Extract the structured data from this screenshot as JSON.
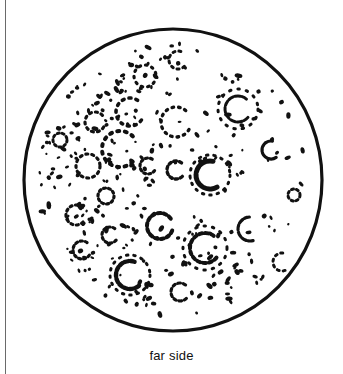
{
  "figure": {
    "caption": "far side",
    "colors": {
      "ink": "#111111",
      "background": "#ffffff",
      "frame_line": "#6a6a6a"
    },
    "disc": {
      "cx": 173,
      "cy": 180,
      "rx": 149,
      "ry": 151,
      "stroke_width": 3.2
    },
    "craters": [
      {
        "cx": 145,
        "cy": 76,
        "r": 11,
        "w": 3.2,
        "dash": "1.5 5",
        "gap": 0
      },
      {
        "cx": 130,
        "cy": 112,
        "r": 14,
        "w": 3.6,
        "dash": "2 5",
        "gap": 70
      },
      {
        "cx": 176,
        "cy": 122,
        "r": 15,
        "w": 3.4,
        "dash": "1.5 5",
        "gap": 60
      },
      {
        "cx": 120,
        "cy": 149,
        "r": 18,
        "w": 4,
        "dash": "2 5.5",
        "gap": 90
      },
      {
        "cx": 176,
        "cy": 170,
        "r": 9,
        "w": 3.4,
        "dash": "2.5 3",
        "gap": 90
      },
      {
        "cx": 210,
        "cy": 175,
        "r": 14,
        "w": 5,
        "dash": "6 2",
        "gap": 120
      },
      {
        "cx": 210,
        "cy": 175,
        "r": 20,
        "w": 3,
        "dash": "1.5 6",
        "gap": 0
      },
      {
        "cx": 238,
        "cy": 109,
        "r": 13,
        "w": 3,
        "dash": "5 2",
        "gap": 80
      },
      {
        "cx": 238,
        "cy": 109,
        "r": 20,
        "w": 3,
        "dash": "1.5 7",
        "gap": 0
      },
      {
        "cx": 271,
        "cy": 150,
        "r": 9,
        "w": 3.2,
        "dash": "8 1",
        "gap": 110
      },
      {
        "cx": 160,
        "cy": 226,
        "r": 13,
        "w": 4,
        "dash": "3 3",
        "gap": 40
      },
      {
        "cx": 205,
        "cy": 248,
        "r": 15,
        "w": 4,
        "dash": "3 3",
        "gap": 80
      },
      {
        "cx": 205,
        "cy": 248,
        "r": 22,
        "w": 3,
        "dash": "1.5 7",
        "gap": 0
      },
      {
        "cx": 250,
        "cy": 229,
        "r": 12,
        "w": 3.2,
        "dash": "5 2",
        "gap": 150
      },
      {
        "cx": 130,
        "cy": 275,
        "r": 14,
        "w": 4.4,
        "dash": "4 2",
        "gap": 100
      },
      {
        "cx": 130,
        "cy": 275,
        "r": 20,
        "w": 3,
        "dash": "1.5 6",
        "gap": 0
      },
      {
        "cx": 180,
        "cy": 292,
        "r": 9,
        "w": 3.2,
        "dash": "2.5 3",
        "gap": 90
      },
      {
        "cx": 95,
        "cy": 122,
        "r": 10,
        "w": 3.2,
        "dash": "2 4",
        "gap": 60
      },
      {
        "cx": 88,
        "cy": 166,
        "r": 12,
        "w": 3.2,
        "dash": "2 4",
        "gap": 0
      },
      {
        "cx": 76,
        "cy": 215,
        "r": 10,
        "w": 3.2,
        "dash": "2 3.5",
        "gap": 90
      },
      {
        "cx": 82,
        "cy": 250,
        "r": 9,
        "w": 3.2,
        "dash": "2 3",
        "gap": 70
      },
      {
        "cx": 106,
        "cy": 196,
        "r": 8,
        "w": 3.2,
        "dash": "2 3",
        "gap": 0
      },
      {
        "cx": 148,
        "cy": 166,
        "r": 8,
        "w": 3.2,
        "dash": "2 3",
        "gap": 70
      },
      {
        "cx": 294,
        "cy": 195,
        "r": 6,
        "w": 3,
        "dash": "2 3",
        "gap": 0
      },
      {
        "cx": 282,
        "cy": 262,
        "r": 9,
        "w": 3,
        "dash": "2 4",
        "gap": 140
      },
      {
        "cx": 178,
        "cy": 60,
        "r": 9,
        "w": 3,
        "dash": "2 4",
        "gap": 90
      },
      {
        "cx": 60,
        "cy": 140,
        "r": 7,
        "w": 3,
        "dash": "2 3",
        "gap": 0
      },
      {
        "cx": 110,
        "cy": 235,
        "r": 8,
        "w": 3.2,
        "dash": "2 3",
        "gap": 80
      }
    ]
  }
}
